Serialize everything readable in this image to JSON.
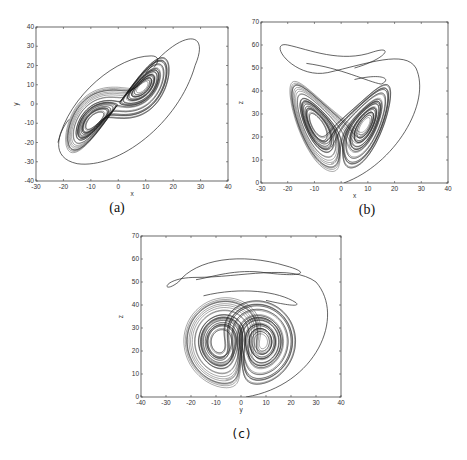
{
  "figure": {
    "panels": [
      {
        "id": "a",
        "caption": "(a)",
        "xlabel": "x",
        "ylabel": "y"
      },
      {
        "id": "b",
        "caption": "(b)",
        "xlabel": "x",
        "ylabel": "z"
      },
      {
        "id": "c",
        "caption": "(c)",
        "xlabel": "y",
        "ylabel": "z"
      }
    ]
  },
  "chart_data": [
    {
      "type": "line",
      "title": "",
      "caption": "(a)",
      "xlabel": "x",
      "ylabel": "y",
      "xlim": [
        -30,
        40
      ],
      "ylim": [
        -40,
        40
      ],
      "xticks": [
        -30,
        -20,
        -10,
        0,
        10,
        20,
        30,
        40
      ],
      "yticks": [
        -40,
        -30,
        -20,
        -10,
        0,
        10,
        20,
        30,
        40
      ],
      "grid": false,
      "description": "Dense elongated elliptical attractor along diagonal y≈x, core spanning x∈[-22,22], y∈[-28,26], with an outer transient loop reaching (28,36) and (-15,-31)",
      "features": {
        "core_center": [
          0,
          0
        ],
        "core_extent_x": [
          -23,
          22
        ],
        "core_extent_y": [
          -28,
          26
        ],
        "outer_loop_max": [
          28,
          36
        ],
        "outer_loop_min": [
          -15,
          -31
        ]
      }
    },
    {
      "type": "line",
      "title": "",
      "caption": "(b)",
      "xlabel": "x",
      "ylabel": "z",
      "xlim": [
        -30,
        40
      ],
      "ylim": [
        0,
        70
      ],
      "xticks": [
        -30,
        -20,
        -10,
        0,
        10,
        20,
        30,
        40
      ],
      "yticks": [
        0,
        10,
        20,
        30,
        40,
        50,
        60,
        70
      ],
      "grid": false,
      "description": "Butterfly-shaped attractor with two lobes centered near x=±8, z≈25; transient loop rising to z≈60 and sweeping out to x≈30",
      "features": {
        "lobe_centers": [
          [
            -9,
            25
          ],
          [
            8,
            25
          ]
        ],
        "lobes_extent_x": [
          -24,
          23
        ],
        "lobes_extent_z": [
          7,
          45
        ],
        "transient_peak_z": 60,
        "transient_max_x": 30
      }
    },
    {
      "type": "line",
      "title": "",
      "caption": "(c)",
      "xlabel": "y",
      "ylabel": "z",
      "xlim": [
        -40,
        40
      ],
      "ylim": [
        0,
        70
      ],
      "xticks": [
        -40,
        -30,
        -20,
        -10,
        0,
        10,
        20,
        30,
        40
      ],
      "yticks": [
        0,
        10,
        20,
        30,
        40,
        50,
        60,
        70
      ],
      "grid": false,
      "description": "Two-lobed attractor with lobes centered near y=±10, z≈23; transient loop rising to z≈60 spanning y∈[-32,25] and sweeping out to y≈36",
      "features": {
        "lobe_centers": [
          [
            -10,
            23
          ],
          [
            8,
            23
          ]
        ],
        "lobes_extent_y": [
          -29,
          26
        ],
        "lobes_extent_z": [
          7,
          45
        ],
        "transient_peak_z": 61,
        "transient_max_y": 36
      }
    }
  ]
}
